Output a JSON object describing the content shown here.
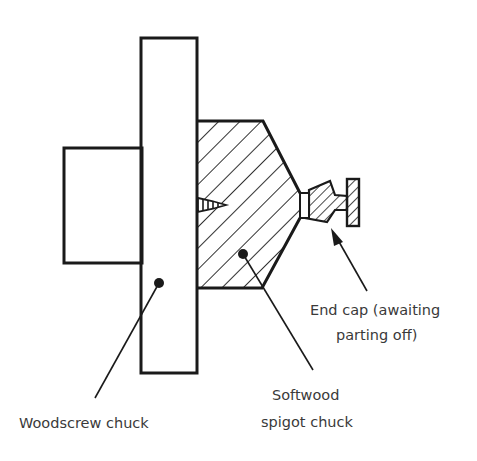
{
  "diagram": {
    "labels": {
      "woodscrew_chuck": "Woodscrew chuck",
      "softwood_line1": "Softwood",
      "softwood_line2": "spigot chuck",
      "endcap_line1": "End cap (awaiting",
      "endcap_line2": "parting off)"
    },
    "components": [
      {
        "name": "backplate-boss",
        "shape": "rectangle"
      },
      {
        "name": "woodscrew-chuck-plate",
        "shape": "rectangle"
      },
      {
        "name": "softwood-spigot-chuck",
        "shape": "hatched-polygon"
      },
      {
        "name": "woodscrew",
        "shape": "screw"
      },
      {
        "name": "end-cap",
        "shape": "hatched-profile"
      }
    ],
    "colors": {
      "line": "#1a1a1a",
      "text": "#3a3a3a",
      "background": "#ffffff"
    }
  }
}
